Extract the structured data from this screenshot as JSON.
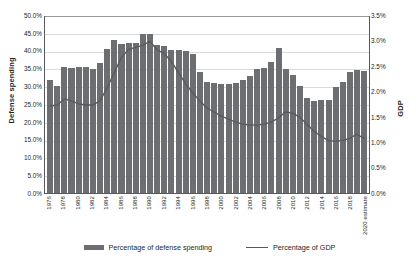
{
  "chart_data": {
    "type": "bar",
    "title": "",
    "subtitle": "",
    "xlabel": "",
    "ylabel": "Defense spending",
    "y2label": "GDP",
    "ylim": [
      0,
      0.5
    ],
    "y2lim": [
      0,
      0.035
    ],
    "grid": true,
    "legend_position": "bottom",
    "categories": [
      "1976",
      "1977",
      "1978",
      "1979",
      "1980",
      "1981",
      "1982",
      "1983",
      "1984",
      "1985",
      "1986",
      "1987",
      "1988",
      "1989",
      "1990",
      "1991",
      "1992",
      "1993",
      "1994",
      "1995",
      "1996",
      "1997",
      "1998",
      "1999",
      "2000",
      "2001",
      "2002",
      "2003",
      "2004",
      "2005",
      "2006",
      "2007",
      "2008",
      "2009",
      "2010",
      "2011",
      "2012",
      "2013",
      "2014",
      "2015",
      "2016",
      "2017",
      "2018",
      "2019",
      "2020 estimate"
    ],
    "y_ticks": [
      "0.0%",
      "5.0%",
      "10.0%",
      "15.0%",
      "20.0%",
      "25.0%",
      "30.0%",
      "35.0%",
      "40.0%",
      "45.0%",
      "50.0%"
    ],
    "y2_ticks": [
      "0.0%",
      "0.5%",
      "1.0%",
      "1.5%",
      "2.0%",
      "2.5%",
      "3.0%",
      "3.5%"
    ],
    "x_tick_labels": [
      "1976",
      "1978",
      "1980",
      "1982",
      "1984",
      "1986",
      "1988",
      "1990",
      "1992",
      "1994",
      "1996",
      "1998",
      "2000",
      "2002",
      "2004",
      "2006",
      "2008",
      "2010",
      "2012",
      "2014",
      "2016",
      "2018",
      "2020 estimate"
    ],
    "series": [
      {
        "name": "Percentage of defense spending",
        "kind": "bar",
        "axis": "left",
        "color": "#6d6e71",
        "values": [
          0.318,
          0.3,
          0.354,
          0.352,
          0.355,
          0.354,
          0.348,
          0.366,
          0.404,
          0.43,
          0.418,
          0.42,
          0.422,
          0.446,
          0.447,
          0.415,
          0.413,
          0.401,
          0.402,
          0.4,
          0.391,
          0.339,
          0.311,
          0.309,
          0.307,
          0.306,
          0.309,
          0.318,
          0.33,
          0.348,
          0.352,
          0.368,
          0.406,
          0.348,
          0.332,
          0.3,
          0.268,
          0.258,
          0.262,
          0.262,
          0.297,
          0.311,
          0.34,
          0.345,
          0.344
        ]
      },
      {
        "name": "Percentage of GDP",
        "kind": "line",
        "axis": "right",
        "color": "#58595b",
        "values": [
          0.0172,
          0.0174,
          0.0186,
          0.0182,
          0.0176,
          0.0174,
          0.0174,
          0.0182,
          0.0208,
          0.0238,
          0.0268,
          0.0284,
          0.0288,
          0.0292,
          0.03,
          0.0283,
          0.0276,
          0.026,
          0.0238,
          0.0216,
          0.0198,
          0.0182,
          0.0168,
          0.016,
          0.0152,
          0.0146,
          0.014,
          0.0136,
          0.0134,
          0.0134,
          0.0136,
          0.014,
          0.0148,
          0.016,
          0.0158,
          0.015,
          0.0136,
          0.0122,
          0.0112,
          0.0104,
          0.0102,
          0.0104,
          0.0108,
          0.0116,
          0.0108
        ]
      }
    ],
    "legend": [
      {
        "label": "Percentage of defense spending",
        "marker": "bar",
        "color": "#6d6e71"
      },
      {
        "label": "Percentage of GDP",
        "marker": "line",
        "color": "#58595b"
      }
    ]
  }
}
